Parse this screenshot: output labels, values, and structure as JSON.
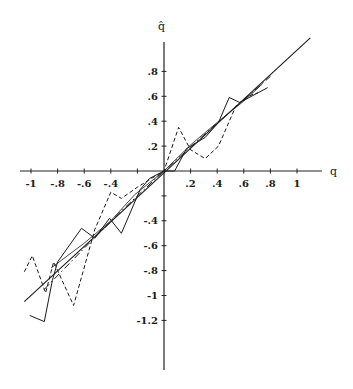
{
  "chart_data": {
    "type": "line",
    "title": "",
    "xlabel": "q",
    "ylabel": "q̂",
    "xlim": [
      -1.05,
      1.2
    ],
    "ylim": [
      -1.6,
      1.1
    ],
    "grid": false,
    "legend": null,
    "x_ticks": [
      -1,
      -0.8,
      -0.6,
      -0.4,
      -0.2,
      0.2,
      0.4,
      0.6,
      0.8,
      1
    ],
    "x_tick_labels": [
      "-1",
      "-.8",
      "-.6",
      "-.4",
      "",
      ".2",
      ".4",
      ".6",
      ".8",
      "1"
    ],
    "y_ticks": [
      0.8,
      0.6,
      0.4,
      0.2,
      -0.2,
      -0.4,
      -0.6,
      -0.8,
      -1,
      -1.2
    ],
    "y_tick_labels": [
      ".8",
      ".6",
      ".4",
      ".2",
      "",
      "-.4",
      "-.6",
      "-.8",
      "-1",
      "-1.2"
    ],
    "series": [
      {
        "name": "reference (q̂ = q)",
        "style": "solid",
        "width": 1.1,
        "points": [
          [
            -1.05,
            -1.05
          ],
          [
            1.1,
            1.07
          ]
        ]
      },
      {
        "name": "dash-dot estimate",
        "style": "dashdot",
        "width": 1.0,
        "points": [
          [
            -0.9,
            -0.95
          ],
          [
            -0.6,
            -0.62
          ],
          [
            -0.3,
            -0.3
          ],
          [
            0,
            0
          ],
          [
            0.3,
            0.29
          ],
          [
            0.6,
            0.57
          ],
          [
            0.8,
            0.76
          ]
        ]
      },
      {
        "name": "solid zig-zag estimate",
        "style": "solid",
        "width": 1.0,
        "points": [
          [
            -1.01,
            -1.16
          ],
          [
            -0.9,
            -1.21
          ],
          [
            -0.84,
            -0.88
          ],
          [
            -0.8,
            -0.73
          ],
          [
            -0.62,
            -0.46
          ],
          [
            -0.52,
            -0.54
          ],
          [
            -0.41,
            -0.38
          ],
          [
            -0.32,
            -0.5
          ],
          [
            -0.18,
            -0.15
          ],
          [
            -0.11,
            -0.06
          ],
          [
            0,
            0
          ],
          [
            0.08,
            0
          ],
          [
            0.17,
            0.18
          ],
          [
            0.31,
            0.27
          ],
          [
            0.41,
            0.39
          ],
          [
            0.49,
            0.59
          ],
          [
            0.57,
            0.55
          ],
          [
            0.71,
            0.63
          ],
          [
            0.78,
            0.67
          ]
        ]
      },
      {
        "name": "dashed zig-zag estimate",
        "style": "dashed",
        "width": 1.0,
        "points": [
          [
            -1.05,
            -0.81
          ],
          [
            -0.99,
            -0.68
          ],
          [
            -0.89,
            -0.98
          ],
          [
            -0.83,
            -0.73
          ],
          [
            -0.68,
            -1.08
          ],
          [
            -0.52,
            -0.47
          ],
          [
            -0.4,
            -0.17
          ],
          [
            -0.32,
            -0.22
          ],
          [
            -0.2,
            -0.13
          ],
          [
            -0.11,
            -0.07
          ],
          [
            0,
            0
          ],
          [
            0.11,
            0.35
          ],
          [
            0.2,
            0.17
          ],
          [
            0.31,
            0.1
          ],
          [
            0.41,
            0.2
          ],
          [
            0.54,
            0.52
          ],
          [
            0.63,
            0.6
          ],
          [
            0.71,
            0.63
          ]
        ]
      },
      {
        "name": "thin smooth estimate",
        "style": "solid",
        "width": 0.8,
        "points": [
          [
            -0.85,
            -0.78
          ],
          [
            -0.6,
            -0.58
          ],
          [
            -0.4,
            -0.4
          ],
          [
            -0.22,
            -0.19
          ],
          [
            0,
            0
          ],
          [
            0.2,
            0.21
          ],
          [
            0.4,
            0.39
          ],
          [
            0.61,
            0.57
          ],
          [
            0.74,
            0.7
          ]
        ]
      }
    ]
  },
  "axes": {
    "x_label": "q",
    "y_label": "q̂"
  }
}
